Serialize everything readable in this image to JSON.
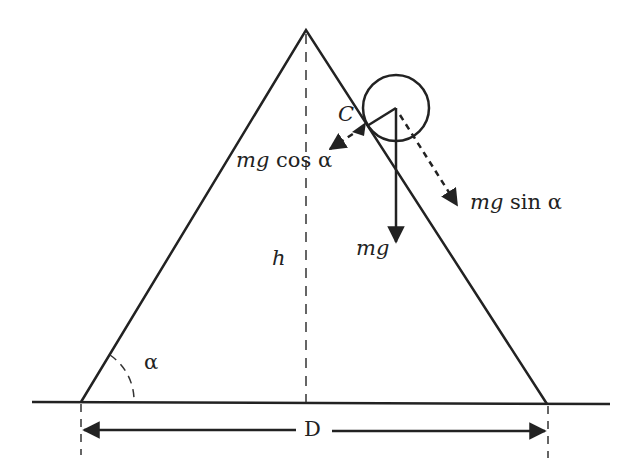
{
  "diagram": {
    "labels": {
      "contact_point": "C",
      "normal_component_var": "mg",
      "normal_component_fn": "cos α",
      "tangential_component_var": "mg",
      "tangential_component_fn": "sin α",
      "weight": "mg",
      "height": "h",
      "angle": "α",
      "base_width": "D"
    },
    "colors": {
      "stroke": "#222222",
      "background": "#ffffff"
    }
  }
}
